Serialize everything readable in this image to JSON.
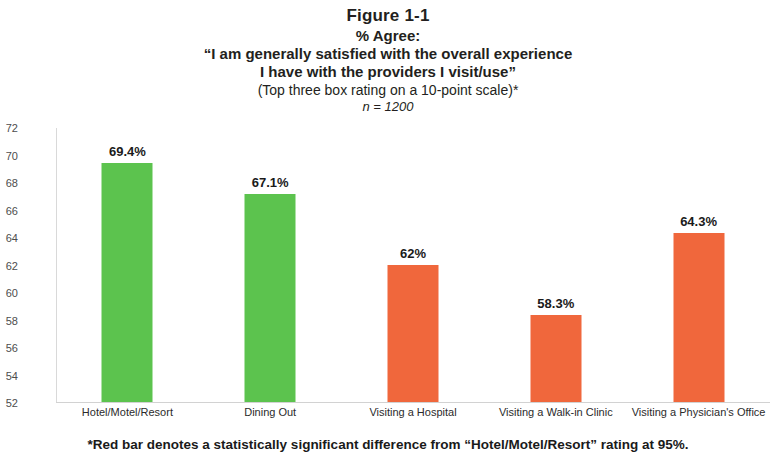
{
  "figure": {
    "number": "Figure 1-1",
    "subtitle": "% Agree:",
    "quote_line_1": "“I am generally satisfied with the overall experience",
    "quote_line_2": "I have with the providers I visit/use”",
    "method_note": "(Top three box rating on a 10-point scale)*",
    "sample_size": "n = 1200",
    "footnote": "*Red bar denotes a statistically significant difference from “Hotel/Motel/Resort” rating at 95%."
  },
  "colors": {
    "green": "#5cc34e",
    "orange": "#f0673c",
    "axis": "#d2d2d2",
    "tick_text": "#4d4d4d"
  },
  "chart_data": {
    "type": "bar",
    "subtitle": "(Top three box rating on a 10-point scale)*  n = 1200",
    "xlabel": "",
    "ylabel": "",
    "ylim": [
      52,
      72
    ],
    "yticks": [
      52,
      54,
      56,
      58,
      60,
      62,
      64,
      66,
      68,
      70,
      72
    ],
    "grid": false,
    "legend": false,
    "categories": [
      "Hotel/Motel/Resort",
      "Dining Out",
      "Visiting a Hospital",
      "Visiting a Walk-in Clinic",
      "Visiting a Physician's Office"
    ],
    "values": [
      69.4,
      67.1,
      62.0,
      58.3,
      64.3
    ],
    "data_labels": [
      "69.4%",
      "67.1%",
      "62%",
      "58.3%",
      "64.3%"
    ],
    "bar_colors": [
      "#5cc34e",
      "#5cc34e",
      "#f0673c",
      "#f0673c",
      "#f0673c"
    ],
    "annotations": [
      "n = 1200"
    ]
  }
}
